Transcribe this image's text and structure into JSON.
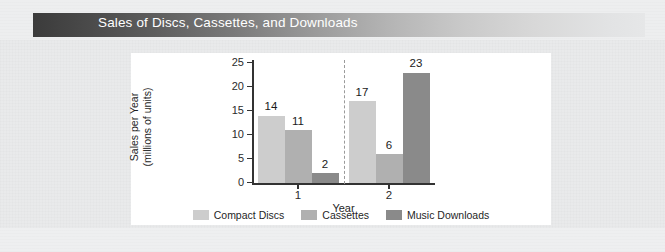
{
  "banner": {
    "title": "Sales of Discs, Cassettes, and Downloads",
    "gradient_from": "#3b3b3b",
    "gradient_to": "#e6e7e8",
    "text_color": "#ffffff"
  },
  "chart_data": {
    "type": "bar",
    "title": "Sales of Discs, Cassettes, and Downloads",
    "xlabel": "Year",
    "ylabel": "Sales per Year (millions of units)",
    "ylabel_line1": "Sales per Year",
    "ylabel_line2": "(millions of units)",
    "categories": [
      "1",
      "2"
    ],
    "ylim": [
      0,
      25
    ],
    "yticks": [
      0,
      5,
      10,
      15,
      20,
      25
    ],
    "ytick_labels": [
      "0",
      "5",
      "10",
      "15",
      "20",
      "25"
    ],
    "xtick_labels": [
      "1",
      "2"
    ],
    "grid": false,
    "legend_position": "bottom",
    "group_divider": true,
    "series": [
      {
        "name": "Compact Discs",
        "color": "#cdcdcd",
        "values": [
          14,
          17
        ],
        "value_labels": [
          "14",
          "17"
        ]
      },
      {
        "name": "Cassettes",
        "color": "#b0b0b0",
        "values": [
          11,
          6
        ],
        "value_labels": [
          "11",
          "6"
        ]
      },
      {
        "name": "Music Downloads",
        "color": "#8a8a8a",
        "values": [
          2,
          23
        ],
        "value_labels": [
          "2",
          "23"
        ]
      }
    ]
  },
  "legend": {
    "items": [
      {
        "label": "Compact Discs",
        "color": "#cdcdcd"
      },
      {
        "label": "Cassettes",
        "color": "#b0b0b0"
      },
      {
        "label": "Music Downloads",
        "color": "#8a8a8a"
      }
    ]
  }
}
